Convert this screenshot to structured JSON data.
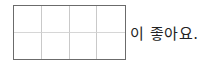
{
  "answer_box": {
    "columns": 4,
    "rows": 2,
    "border_color": "#6b6b6b",
    "grid_color": "#c9c9c9"
  },
  "sentence": {
    "suffix_text": "이 좋아요."
  }
}
